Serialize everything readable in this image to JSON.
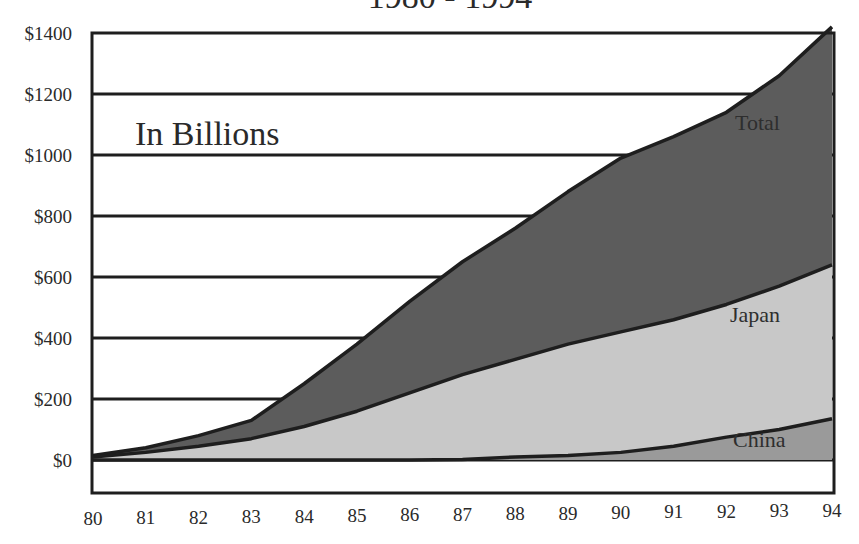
{
  "title": "1980 - 1994",
  "annotation": "In Billions",
  "colors": {
    "total_fill": "#5c5c5c",
    "japan_fill": "#c8c8c8",
    "china_fill": "#9a9a9a",
    "line": "#1e1e1e",
    "background": "#ffffff",
    "text": "#2a2a2a"
  },
  "chart_data": {
    "type": "area",
    "title": "1980 - 1994",
    "subtitle": "In Billions",
    "xlabel": "",
    "ylabel": "",
    "categories": [
      "80",
      "81",
      "82",
      "83",
      "84",
      "85",
      "86",
      "87",
      "88",
      "89",
      "90",
      "91",
      "92",
      "93",
      "94"
    ],
    "y_tick_labels": [
      "$0",
      "$200",
      "$400",
      "$600",
      "$800",
      "$1000",
      "$1200",
      "$1400"
    ],
    "y_ticks": [
      0,
      200,
      400,
      600,
      800,
      1000,
      1200,
      1400
    ],
    "ylim": [
      -100,
      1400
    ],
    "grid": true,
    "legend": "inline labels",
    "series": [
      {
        "name": "Total",
        "values": [
          15,
          40,
          80,
          130,
          250,
          380,
          520,
          650,
          760,
          880,
          990,
          1060,
          1140,
          1260,
          1420
        ]
      },
      {
        "name": "Japan",
        "values": [
          10,
          25,
          45,
          70,
          110,
          160,
          220,
          280,
          330,
          380,
          420,
          460,
          510,
          570,
          640
        ]
      },
      {
        "name": "China",
        "values": [
          0,
          0,
          0,
          0,
          0,
          0,
          0,
          2,
          10,
          15,
          25,
          45,
          75,
          100,
          135
        ]
      }
    ],
    "series_labels": [
      {
        "name": "Total",
        "text": "Total"
      },
      {
        "name": "Japan",
        "text": "Japan"
      },
      {
        "name": "China",
        "text": "China"
      }
    ]
  }
}
